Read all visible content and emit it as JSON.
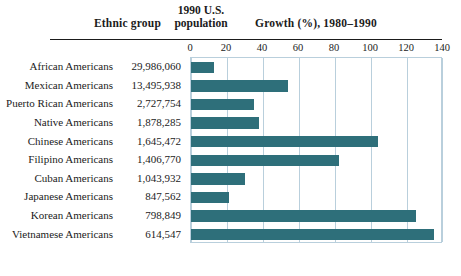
{
  "header": {
    "ethnic_group_label": "Ethnic group",
    "population_label_line1": "1990 U.S.",
    "population_label_line2": "population",
    "growth_label": "Growth (%), 1980–1990"
  },
  "chart_data": {
    "type": "bar",
    "orientation": "horizontal",
    "title": "Growth (%), 1980–1990",
    "xlabel": "Growth (%), 1980–1990",
    "ylabel": "Ethnic group",
    "xlim": [
      0,
      140
    ],
    "xticks": [
      0,
      20,
      40,
      60,
      80,
      100,
      120,
      140
    ],
    "xtick_labels": [
      "0",
      "20",
      "40",
      "60",
      "80",
      "100",
      "120",
      "140"
    ],
    "grid": true,
    "legend": false,
    "bar_color": "#2e6f7a",
    "grid_color": "#b9cfdc",
    "categories": [
      "African Americans",
      "Mexican Americans",
      "Puerto Rican Americans",
      "Native Americans",
      "Chinese Americans",
      "Filipino Americans",
      "Cuban Americans",
      "Japanese Americans",
      "Korean Americans",
      "Vietnamese Americans"
    ],
    "values": [
      13,
      54,
      35,
      38,
      104,
      82,
      30,
      21,
      125,
      135
    ],
    "population_labels": [
      "29,986,060",
      "13,495,938",
      "2,727,754",
      "1,878,285",
      "1,645,472",
      "1,406,770",
      "1,043,932",
      "847,562",
      "798,849",
      "614,547"
    ]
  }
}
